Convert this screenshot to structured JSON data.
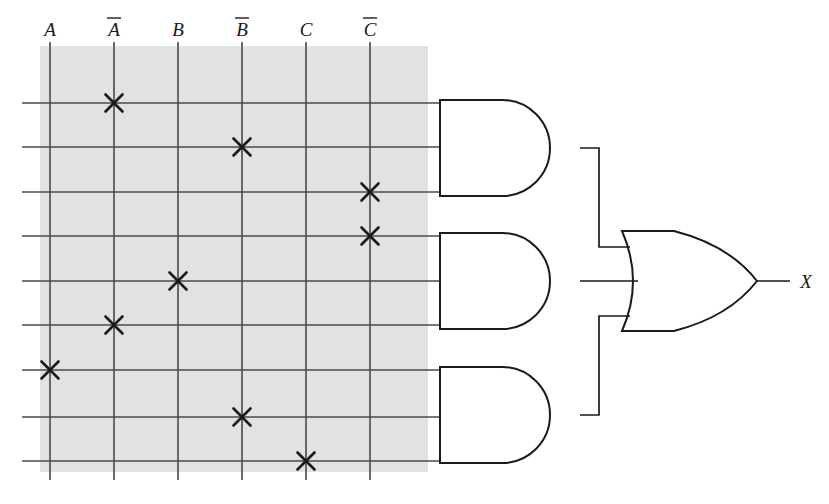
{
  "diagram": {
    "output_label": "X",
    "colors": {
      "line": "#4a4a4a",
      "gate_stroke": "#1a1a1a",
      "cross": "#1a1a1a",
      "array_fill": "#e2e2e2",
      "background": "#ffffff",
      "label": "#1a1a1a"
    },
    "input_columns": [
      {
        "id": "col-a",
        "label": "A",
        "overbar": false,
        "x": 50
      },
      {
        "id": "col-nota",
        "label": "A",
        "overbar": true,
        "x": 114
      },
      {
        "id": "col-b",
        "label": "B",
        "overbar": false,
        "x": 178
      },
      {
        "id": "col-notb",
        "label": "B",
        "overbar": true,
        "x": 242
      },
      {
        "id": "col-c",
        "label": "C",
        "overbar": false,
        "x": 306
      },
      {
        "id": "col-notc",
        "label": "C",
        "overbar": true,
        "x": 370
      }
    ],
    "array": {
      "x": 40,
      "y": 46,
      "width": 388,
      "height": 426
    },
    "column_line": {
      "top": 42,
      "bottom": 480
    },
    "product_rows": [
      {
        "id": "row-1",
        "y": 103,
        "cross_col": 1,
        "gate": "and-gate-1",
        "input_index": 0
      },
      {
        "id": "row-2",
        "y": 147,
        "cross_col": 3,
        "gate": "and-gate-1",
        "input_index": 1
      },
      {
        "id": "row-3",
        "y": 192,
        "cross_col": 5,
        "gate": "and-gate-1",
        "input_index": 2
      },
      {
        "id": "row-4",
        "y": 236,
        "cross_col": 5,
        "gate": "and-gate-2",
        "input_index": 0
      },
      {
        "id": "row-5",
        "y": 281,
        "cross_col": 2,
        "gate": "and-gate-2",
        "input_index": 1
      },
      {
        "id": "row-6",
        "y": 325,
        "cross_col": 1,
        "gate": "and-gate-2",
        "input_index": 2
      },
      {
        "id": "row-7",
        "y": 370,
        "cross_col": 0,
        "gate": "and-gate-3",
        "input_index": 0
      },
      {
        "id": "row-8",
        "y": 417,
        "cross_col": 3,
        "gate": "and-gate-3",
        "input_index": 1
      },
      {
        "id": "row-9",
        "y": 461,
        "cross_col": 4,
        "gate": "and-gate-3",
        "input_index": 2
      }
    ],
    "row_line": {
      "left": 22,
      "right": 440
    },
    "and_gates": [
      {
        "id": "and-gate-1",
        "name": "and-gate-1",
        "x": 440,
        "top": 100,
        "bottom": 196,
        "out_x": 580,
        "out_y": 148
      },
      {
        "id": "and-gate-2",
        "name": "and-gate-2",
        "x": 440,
        "top": 233,
        "bottom": 329,
        "out_x": 580,
        "out_y": 281
      },
      {
        "id": "and-gate-3",
        "name": "and-gate-3",
        "x": 440,
        "top": 367,
        "bottom": 463,
        "out_x": 580,
        "out_y": 415
      }
    ],
    "or_gate": {
      "id": "or-gate",
      "name": "or-gate",
      "x": 622,
      "top": 231,
      "bottom": 331,
      "tip_x": 757,
      "tip_y": 281,
      "inputs_y": [
        247,
        281,
        316
      ],
      "output_wire_end": 790
    },
    "bus_x": 599,
    "cross_marks": [
      {
        "row": 1,
        "col": "col-nota",
        "x": 114,
        "y": 103
      },
      {
        "row": 2,
        "col": "col-notb",
        "x": 242,
        "y": 147
      },
      {
        "row": 3,
        "col": "col-notc",
        "x": 370,
        "y": 192
      },
      {
        "row": 4,
        "col": "col-notc",
        "x": 370,
        "y": 236
      },
      {
        "row": 5,
        "col": "col-b",
        "x": 178,
        "y": 281
      },
      {
        "row": 6,
        "col": "col-nota",
        "x": 114,
        "y": 325
      },
      {
        "row": 7,
        "col": "col-a",
        "x": 50,
        "y": 370
      },
      {
        "row": 8,
        "col": "col-notb",
        "x": 242,
        "y": 417
      },
      {
        "row": 9,
        "col": "col-c",
        "x": 306,
        "y": 461
      }
    ]
  }
}
